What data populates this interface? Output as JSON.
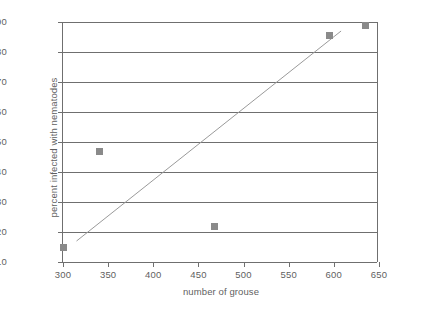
{
  "chart_data": {
    "type": "scatter",
    "title": "",
    "xlabel": "number of grouse",
    "ylabel": "percent infected with nematodes",
    "xlim": [
      300,
      650
    ],
    "ylim": [
      10,
      90
    ],
    "xticks": [
      300,
      350,
      400,
      450,
      500,
      550,
      600,
      650
    ],
    "yticks": [
      10,
      20,
      30,
      40,
      50,
      60,
      70,
      80,
      90
    ],
    "grid": "horizontal",
    "legend": "none",
    "marker": "square",
    "marker_color": "#8a8a8a",
    "line_color": "#9a9a9a",
    "axis_color": "#6f6f6f",
    "background": "#ffffff",
    "points": [
      {
        "x": 300,
        "y": 15
      },
      {
        "x": 340,
        "y": 47
      },
      {
        "x": 468,
        "y": 22
      },
      {
        "x": 595,
        "y": 85.5
      },
      {
        "x": 635,
        "y": 89
      }
    ],
    "trendline": {
      "x0": 315,
      "y0": 17,
      "x1": 608,
      "y1": 87
    }
  }
}
